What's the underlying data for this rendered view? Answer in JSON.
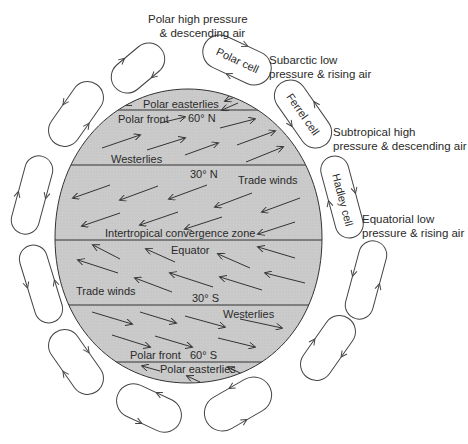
{
  "outer_labels": {
    "polar_high": [
      "Polar high pressure",
      "& descending air"
    ],
    "subarctic_low": [
      "Subarctic low",
      "pressure & rising air"
    ],
    "subtropical_high": [
      "Subtropical high",
      "pressure & descending air"
    ],
    "equatorial_low": [
      "Equatorial low",
      "pressure & rising air"
    ]
  },
  "cells": {
    "polar": "Polar cell",
    "ferrel": "Ferrel cell",
    "hadley": "Hadley cell"
  },
  "globe": {
    "polar_easterlies_n": "Polar easterlies",
    "polar_front_n": "Polar front",
    "lat_60n": "60° N",
    "westerlies_n": "Westerlies",
    "lat_30n": "30° N",
    "trade_winds_n": "Trade winds",
    "itcz": "Intertropical convergence zone",
    "equator": "Equator",
    "trade_winds_s": "Trade winds",
    "lat_30s": "30° S",
    "westerlies_s": "Westerlies",
    "polar_front_s": "Polar front",
    "lat_60s": "60° S",
    "polar_easterlies_s": "Polar easterlies"
  },
  "colors": {
    "globe_fill": "#c9c9c9",
    "stroke": "#333333",
    "text": "#2a2a2a"
  }
}
